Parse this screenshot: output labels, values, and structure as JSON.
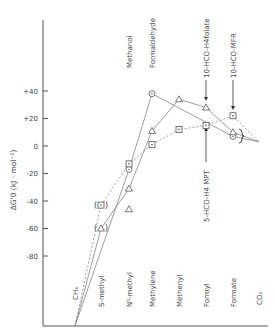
{
  "chart_data": {
    "type": "line",
    "title": "",
    "xlabel": "",
    "ylabel": "ΔG'0 (kJ · mol⁻¹)",
    "ylim": [
      -130,
      55
    ],
    "yticks": [
      40,
      20,
      0,
      -20,
      -40,
      -60,
      -80
    ],
    "ytick_labels": [
      "+40",
      "+20",
      "0",
      "-20",
      "-40",
      "-60",
      "-80"
    ],
    "grid": false,
    "legend": "none",
    "categories": [
      "CH4",
      "S-methyl",
      "N5-methyl",
      "Methylene",
      "Methenyl",
      "Formyl",
      "Formate",
      "CO2"
    ],
    "category_labels": [
      "CH₄",
      "S-methyl",
      "N⁵-methyl",
      "Methylene",
      "Methenyl",
      "Formyl",
      "Formate",
      "CO₂"
    ],
    "top_labels": [
      {
        "text": "Methanol",
        "category": "N5-methyl"
      },
      {
        "text": "Formaldehyde",
        "category": "Methylene"
      },
      {
        "text": "10-HCO-H4folate",
        "category": "Formyl",
        "arrow": "down"
      },
      {
        "text": "10-HCO-MFR",
        "category": "Formate",
        "arrow": "down"
      }
    ],
    "bottom_annotation": {
      "text": "5-HCO-H4 MPT",
      "category": "Formyl",
      "arrow": "up"
    },
    "series": [
      {
        "name": "circles",
        "marker": "circle",
        "line": "solid",
        "points": [
          {
            "category": "CH4",
            "value": -130
          },
          {
            "category": "N5-methyl",
            "value": -17
          },
          {
            "category": "Methylene",
            "value": 38
          },
          {
            "category": "Formate",
            "value": 7
          },
          {
            "category": "CO2",
            "value": 3
          }
        ]
      },
      {
        "name": "triangles",
        "marker": "triangle",
        "line": "solid",
        "points": [
          {
            "category": "CH4",
            "value": -130
          },
          {
            "category": "S-methyl",
            "value": -60,
            "bracketed": true
          },
          {
            "category": "N5-methyl",
            "value": -31
          },
          {
            "category": "Methylene",
            "value": 11
          },
          {
            "category": "Methenyl",
            "value": 34
          },
          {
            "category": "Formyl",
            "value": 28
          },
          {
            "category": "Formate",
            "value": 10
          },
          {
            "category": "CO2",
            "value": 3
          }
        ],
        "isolated_points": [
          {
            "category": "N5-methyl",
            "value": -46
          }
        ]
      },
      {
        "name": "squares",
        "marker": "square",
        "line": "dashed",
        "points": [
          {
            "category": "CH4",
            "value": -130
          },
          {
            "category": "S-methyl",
            "value": -43,
            "bracketed": true
          },
          {
            "category": "N5-methyl",
            "value": -13
          },
          {
            "category": "Methylene",
            "value": 1
          },
          {
            "category": "Methenyl",
            "value": 12
          },
          {
            "category": "Formyl",
            "value": 15
          },
          {
            "category": "Formate",
            "value": 22
          },
          {
            "category": "CO2",
            "value": 3
          }
        ]
      }
    ]
  }
}
